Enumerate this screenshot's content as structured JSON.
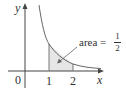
{
  "diagram": {
    "function": "y = 1/x^2",
    "axes": {
      "x_label": "x",
      "y_label": "y",
      "origin_label": "0"
    },
    "ticks": [
      "1",
      "2"
    ],
    "shaded_region": {
      "from": 1,
      "to": 2
    },
    "annotation": {
      "prefix": "area =",
      "numerator": "1",
      "denominator": "2"
    },
    "colors": {
      "curve": "#555555",
      "shade": "#e6e6e6",
      "axis": "#444444"
    }
  }
}
